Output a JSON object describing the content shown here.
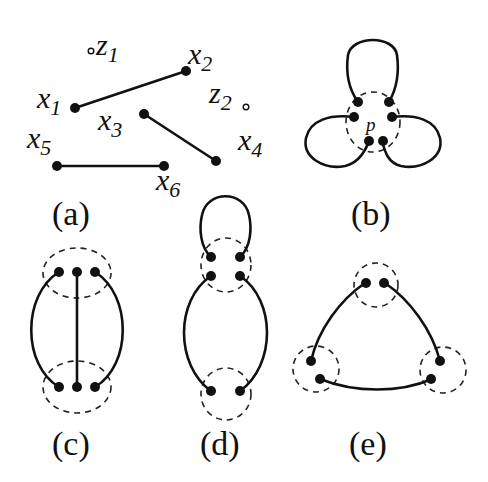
{
  "panels": {
    "a": {
      "caption": "(a)",
      "points": [
        {
          "name": "x",
          "sub": "1"
        },
        {
          "name": "x",
          "sub": "2"
        },
        {
          "name": "x",
          "sub": "3"
        },
        {
          "name": "x",
          "sub": "4"
        },
        {
          "name": "x",
          "sub": "5"
        },
        {
          "name": "x",
          "sub": "6"
        },
        {
          "name": "z",
          "sub": "1"
        },
        {
          "name": "z",
          "sub": "2"
        }
      ],
      "edges": [
        [
          "x1",
          "x2"
        ],
        [
          "x3",
          "x4"
        ],
        [
          "x5",
          "x6"
        ]
      ]
    },
    "b": {
      "caption": "(b)",
      "center_label": "p"
    },
    "c": {
      "caption": "(c)"
    },
    "d": {
      "caption": "(d)"
    },
    "e": {
      "caption": "(e)"
    }
  },
  "colors": {
    "ink": "#111111",
    "background": "#ffffff"
  }
}
